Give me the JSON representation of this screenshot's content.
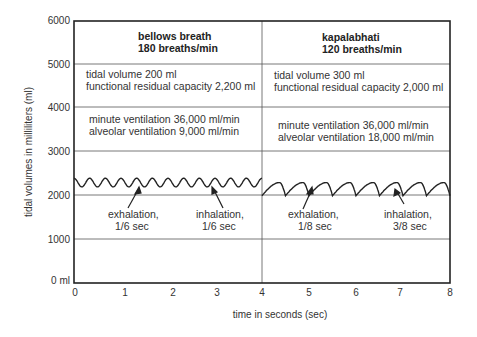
{
  "chart_data": {
    "type": "line",
    "title": "",
    "xlabel": "time in seconds (sec)",
    "ylabel": "tidal volumes in milliliters (ml)",
    "xlim": [
      0,
      8
    ],
    "ylim": [
      0,
      6000
    ],
    "x_ticks": [
      "0",
      "1",
      "2",
      "3",
      "4",
      "5",
      "6",
      "7",
      "8"
    ],
    "y_ticks": [
      "0 ml",
      "1000",
      "2000",
      "3000",
      "4000",
      "5000",
      "6000"
    ],
    "grid": "horizontal lines at 1000-6000; vertical divider at x=4",
    "series": [
      {
        "name": "bellows breath",
        "x_range": [
          0,
          4
        ],
        "breaths_per_min": 180,
        "cycles_per_sec": 3,
        "min_ml": 2200,
        "max_ml": 2400,
        "shape": "sinusoidal"
      },
      {
        "name": "kapalabhati",
        "x_range": [
          4,
          8
        ],
        "breaths_per_min": 120,
        "cycles_per_sec": 2,
        "min_ml": 2000,
        "max_ml": 2300,
        "shape": "sawtooth (slow rise 3/8 s, fast fall 1/8 s)"
      }
    ],
    "panels": [
      {
        "heading": "bellows breath",
        "rate": "180 breaths/min",
        "tidal_volume": "tidal volume 200 ml",
        "frc": "functional residual capacity 2,200 ml",
        "minute_ventilation": "minute ventilation 36,000 ml/min",
        "alveolar_ventilation": "alveolar ventilation 9,000 ml/min",
        "annotations": [
          {
            "label": "exhalation,",
            "sub": "1/6 sec"
          },
          {
            "label": "inhalation,",
            "sub": "1/6 sec"
          }
        ]
      },
      {
        "heading": "kapalabhati",
        "rate": "120 breaths/min",
        "tidal_volume": "tidal volume 300 ml",
        "frc": "functional residual capacity 2,000 ml",
        "minute_ventilation": "minute ventilation 36,000 ml/min",
        "alveolar_ventilation": "alveolar ventilation 18,000 ml/min",
        "annotations": [
          {
            "label": "exhalation,",
            "sub": "1/8 sec"
          },
          {
            "label": "inhalation,",
            "sub": "3/8 sec"
          }
        ]
      }
    ]
  }
}
